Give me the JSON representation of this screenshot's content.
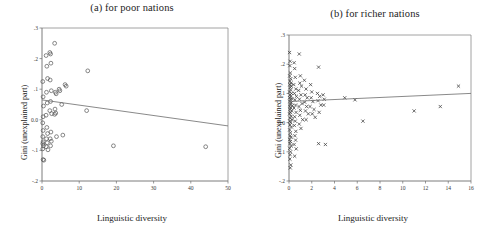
{
  "figure": {
    "x_axis_title": "Linguistic diversity",
    "y_axis_title": "Gini (unexplained part)"
  },
  "chart_data": [
    {
      "type": "scatter",
      "title": "(a) for poor nations",
      "xlabel": "Linguistic diversity",
      "ylabel": "Gini (unexplained part)",
      "xlim": [
        0,
        50
      ],
      "ylim": [
        -2,
        3
      ],
      "xticks": [
        0,
        10,
        20,
        30,
        40,
        50
      ],
      "xtick_labels": [
        "0",
        "10",
        "20",
        "30",
        "40",
        "50"
      ],
      "yticks": [
        -2,
        -1,
        0,
        1,
        2,
        3
      ],
      "ytick_labels": [
        "-.2",
        "-.1",
        "0.0",
        ".1",
        ".2",
        ".3"
      ],
      "grid": false,
      "legend": "none",
      "marker": "open-circle",
      "trend_line": {
        "x0": 0,
        "y0": 0.65,
        "x1": 50,
        "y1": -0.2
      },
      "points": [
        {
          "x": 0.2,
          "y": 1.25
        },
        {
          "x": 0.3,
          "y": 0.75
        },
        {
          "x": 0.4,
          "y": 0.45
        },
        {
          "x": 0.3,
          "y": 0.1
        },
        {
          "x": 0.2,
          "y": -0.1
        },
        {
          "x": 0.3,
          "y": -0.35
        },
        {
          "x": 0.2,
          "y": -0.55
        },
        {
          "x": 0.3,
          "y": -0.72
        },
        {
          "x": 0.2,
          "y": -0.78
        },
        {
          "x": 0.4,
          "y": -0.85
        },
        {
          "x": 0.2,
          "y": -0.95
        },
        {
          "x": 0.3,
          "y": -1.3
        },
        {
          "x": 0.5,
          "y": -1.32
        },
        {
          "x": 1.1,
          "y": 2.1
        },
        {
          "x": 1.3,
          "y": 1.75
        },
        {
          "x": 1.5,
          "y": 1.35
        },
        {
          "x": 1.2,
          "y": 0.9
        },
        {
          "x": 1.4,
          "y": 0.55
        },
        {
          "x": 1.1,
          "y": 0.15
        },
        {
          "x": 1.3,
          "y": -0.25
        },
        {
          "x": 1.5,
          "y": -0.45
        },
        {
          "x": 1.2,
          "y": -0.62
        },
        {
          "x": 1.4,
          "y": -0.75
        },
        {
          "x": 1.1,
          "y": -0.88
        },
        {
          "x": 1.6,
          "y": -0.98
        },
        {
          "x": 2.1,
          "y": 2.2
        },
        {
          "x": 2.3,
          "y": 2.15
        },
        {
          "x": 2.4,
          "y": 1.85
        },
        {
          "x": 2.2,
          "y": 1.3
        },
        {
          "x": 2.5,
          "y": 0.95
        },
        {
          "x": 2.3,
          "y": 0.6
        },
        {
          "x": 2.1,
          "y": 0.3
        },
        {
          "x": 2.6,
          "y": 0.2
        },
        {
          "x": 2.4,
          "y": -0.4
        },
        {
          "x": 2.2,
          "y": -0.62
        },
        {
          "x": 2.5,
          "y": -0.7
        },
        {
          "x": 2.3,
          "y": -0.85
        },
        {
          "x": 3.4,
          "y": 2.5
        },
        {
          "x": 3.6,
          "y": 0.9
        },
        {
          "x": 3.8,
          "y": 0.85
        },
        {
          "x": 3.5,
          "y": 0.35
        },
        {
          "x": 3.7,
          "y": 0.22
        },
        {
          "x": 3.4,
          "y": 0.18
        },
        {
          "x": 3.9,
          "y": -0.55
        },
        {
          "x": 4.6,
          "y": 1.0
        },
        {
          "x": 4.8,
          "y": 0.95
        },
        {
          "x": 5.3,
          "y": 0.5
        },
        {
          "x": 5.6,
          "y": -0.5
        },
        {
          "x": 6.2,
          "y": 1.15
        },
        {
          "x": 6.5,
          "y": 1.1
        },
        {
          "x": 12.3,
          "y": 1.6
        },
        {
          "x": 12.0,
          "y": 0.3
        },
        {
          "x": 19.2,
          "y": -0.85
        },
        {
          "x": 44.0,
          "y": -0.88
        }
      ]
    },
    {
      "type": "scatter",
      "title": "(b) for richer nations",
      "xlabel": "Linguistic diversity",
      "ylabel": "Gini (unexplained part)",
      "xlim": [
        0,
        16
      ],
      "ylim": [
        -2,
        3
      ],
      "xticks": [
        0,
        2,
        4,
        6,
        8,
        10,
        12,
        14,
        16
      ],
      "xtick_labels": [
        "0",
        "2",
        "4",
        "6",
        "8",
        "10",
        "12",
        "14",
        "16"
      ],
      "yticks": [
        -2,
        -1,
        0,
        1,
        2,
        3
      ],
      "ytick_labels": [
        "-.2",
        "-.1",
        "0.0",
        ".1",
        ".2",
        ".3"
      ],
      "grid": false,
      "legend": "none",
      "marker": "cross",
      "trend_line": {
        "x0": 0,
        "y0": 0.72,
        "x1": 16,
        "y1": 1.0
      },
      "points": [
        {
          "x": 0.05,
          "y": 2.4
        },
        {
          "x": 0.1,
          "y": 2.1
        },
        {
          "x": 0.08,
          "y": 1.95
        },
        {
          "x": 0.12,
          "y": 1.7
        },
        {
          "x": 0.06,
          "y": 1.6
        },
        {
          "x": 0.15,
          "y": 1.5
        },
        {
          "x": 0.09,
          "y": 1.42
        },
        {
          "x": 0.18,
          "y": 1.35
        },
        {
          "x": 0.07,
          "y": 1.3
        },
        {
          "x": 0.2,
          "y": 1.25
        },
        {
          "x": 0.11,
          "y": 1.2
        },
        {
          "x": 0.14,
          "y": 1.12
        },
        {
          "x": 0.05,
          "y": 1.05
        },
        {
          "x": 0.22,
          "y": 1.0
        },
        {
          "x": 0.1,
          "y": 0.95
        },
        {
          "x": 0.17,
          "y": 0.9
        },
        {
          "x": 0.06,
          "y": 0.85
        },
        {
          "x": 0.25,
          "y": 0.82
        },
        {
          "x": 0.13,
          "y": 0.78
        },
        {
          "x": 0.08,
          "y": 0.72
        },
        {
          "x": 0.2,
          "y": 0.68
        },
        {
          "x": 0.11,
          "y": 0.62
        },
        {
          "x": 0.3,
          "y": 0.58
        },
        {
          "x": 0.07,
          "y": 0.55
        },
        {
          "x": 0.16,
          "y": 0.5
        },
        {
          "x": 0.09,
          "y": 0.45
        },
        {
          "x": 0.24,
          "y": 0.4
        },
        {
          "x": 0.12,
          "y": 0.35
        },
        {
          "x": 0.05,
          "y": 0.3
        },
        {
          "x": 0.19,
          "y": 0.22
        },
        {
          "x": 0.1,
          "y": 0.15
        },
        {
          "x": 0.28,
          "y": 0.1
        },
        {
          "x": 0.07,
          "y": 0.05
        },
        {
          "x": 0.15,
          "y": 0.0
        },
        {
          "x": 0.09,
          "y": -0.08
        },
        {
          "x": 0.21,
          "y": -0.15
        },
        {
          "x": 0.06,
          "y": -0.25
        },
        {
          "x": 0.13,
          "y": -0.35
        },
        {
          "x": 0.1,
          "y": -0.45
        },
        {
          "x": 0.18,
          "y": -0.5
        },
        {
          "x": 0.07,
          "y": -0.58
        },
        {
          "x": 0.12,
          "y": -0.65
        },
        {
          "x": 0.09,
          "y": -0.72
        },
        {
          "x": 0.2,
          "y": -0.8
        },
        {
          "x": 0.06,
          "y": -0.88
        },
        {
          "x": 0.14,
          "y": -1.0
        },
        {
          "x": 0.1,
          "y": -1.1
        },
        {
          "x": 0.08,
          "y": -1.25
        },
        {
          "x": 0.16,
          "y": -1.45
        },
        {
          "x": 0.11,
          "y": -1.55
        },
        {
          "x": 0.45,
          "y": 2.05
        },
        {
          "x": 0.5,
          "y": 1.85
        },
        {
          "x": 0.55,
          "y": 1.55
        },
        {
          "x": 0.42,
          "y": 1.3
        },
        {
          "x": 0.6,
          "y": 1.15
        },
        {
          "x": 0.48,
          "y": 1.0
        },
        {
          "x": 0.65,
          "y": 0.9
        },
        {
          "x": 0.52,
          "y": 0.78
        },
        {
          "x": 0.58,
          "y": 0.6
        },
        {
          "x": 0.44,
          "y": 0.5
        },
        {
          "x": 0.62,
          "y": 0.35
        },
        {
          "x": 0.5,
          "y": 0.2
        },
        {
          "x": 0.55,
          "y": 0.05
        },
        {
          "x": 0.47,
          "y": -0.1
        },
        {
          "x": 0.6,
          "y": -0.3
        },
        {
          "x": 0.52,
          "y": -0.45
        },
        {
          "x": 0.58,
          "y": -0.6
        },
        {
          "x": 0.45,
          "y": -0.75
        },
        {
          "x": 0.63,
          "y": -0.9
        },
        {
          "x": 0.5,
          "y": -1.15
        },
        {
          "x": 0.9,
          "y": 2.35
        },
        {
          "x": 1.0,
          "y": 1.6
        },
        {
          "x": 0.95,
          "y": 1.35
        },
        {
          "x": 1.1,
          "y": 1.25
        },
        {
          "x": 0.85,
          "y": 1.1
        },
        {
          "x": 1.05,
          "y": 0.95
        },
        {
          "x": 0.92,
          "y": 0.8
        },
        {
          "x": 1.15,
          "y": 0.65
        },
        {
          "x": 0.88,
          "y": 0.55
        },
        {
          "x": 1.0,
          "y": 0.42
        },
        {
          "x": 0.95,
          "y": 0.25
        },
        {
          "x": 1.2,
          "y": 0.1
        },
        {
          "x": 0.9,
          "y": -0.05
        },
        {
          "x": 1.05,
          "y": -0.2
        },
        {
          "x": 1.35,
          "y": 1.45
        },
        {
          "x": 1.5,
          "y": 1.15
        },
        {
          "x": 1.42,
          "y": 0.95
        },
        {
          "x": 1.6,
          "y": 0.85
        },
        {
          "x": 1.38,
          "y": 0.7
        },
        {
          "x": 1.55,
          "y": 0.55
        },
        {
          "x": 1.45,
          "y": 0.4
        },
        {
          "x": 1.7,
          "y": 0.3
        },
        {
          "x": 1.5,
          "y": 0.1
        },
        {
          "x": 1.9,
          "y": 1.3
        },
        {
          "x": 2.0,
          "y": 1.05
        },
        {
          "x": 1.95,
          "y": 0.85
        },
        {
          "x": 2.1,
          "y": 0.72
        },
        {
          "x": 1.85,
          "y": 0.55
        },
        {
          "x": 2.2,
          "y": 0.45
        },
        {
          "x": 2.05,
          "y": 0.3
        },
        {
          "x": 2.3,
          "y": 0.18
        },
        {
          "x": 2.6,
          "y": 1.9
        },
        {
          "x": 2.5,
          "y": 1.0
        },
        {
          "x": 2.7,
          "y": 0.9
        },
        {
          "x": 2.55,
          "y": 0.75
        },
        {
          "x": 2.8,
          "y": 0.6
        },
        {
          "x": 2.65,
          "y": 0.35
        },
        {
          "x": 2.6,
          "y": -0.72
        },
        {
          "x": 3.0,
          "y": 0.95
        },
        {
          "x": 3.1,
          "y": 0.8
        },
        {
          "x": 3.05,
          "y": 0.6
        },
        {
          "x": 3.2,
          "y": -0.75
        },
        {
          "x": 4.9,
          "y": 0.85
        },
        {
          "x": 5.8,
          "y": 0.78
        },
        {
          "x": 6.5,
          "y": 0.05
        },
        {
          "x": 11.0,
          "y": 0.4
        },
        {
          "x": 13.3,
          "y": 0.55
        },
        {
          "x": 14.9,
          "y": 1.25
        }
      ]
    }
  ]
}
